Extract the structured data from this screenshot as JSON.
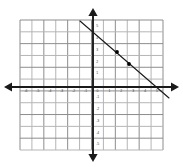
{
  "figure": {
    "background_color": "#ffffff"
  },
  "colors": {
    "grid_line": "#8d8d8d",
    "grid_line_light": "#b5b5b5",
    "axis": "#1a1a1a",
    "graph_line": "#1a1a1a",
    "point_marker": "#000000",
    "tick_label": "#3a3a3a"
  },
  "grid": {
    "left_px": 20,
    "top_px": 20,
    "right_px": 163,
    "bottom_px": 150,
    "cell_px": 11.9,
    "columns": 12,
    "rows": 11,
    "show_grid": true
  },
  "axes": {
    "x_axis": {
      "label": "",
      "origin_px": 87,
      "arrow_left_px": 4,
      "arrow_right_px": 179,
      "min": -6,
      "max": 6,
      "tick_labels": [
        "-6",
        "-5",
        "-4",
        "-3",
        "-2",
        "-1",
        "0",
        "1",
        "2",
        "3",
        "4",
        "5"
      ]
    },
    "y_axis": {
      "label": "",
      "origin_px": 93,
      "arrow_top_px": 8,
      "arrow_bottom_px": 162,
      "min": -5,
      "max": 5,
      "tick_labels": [
        "5",
        "4",
        "3",
        "2",
        "1",
        "-1",
        "-2",
        "-3",
        "-4",
        "-5"
      ]
    }
  },
  "chart_data": {
    "type": "line",
    "title": "",
    "xlabel": "",
    "ylabel": "",
    "xlim": [
      -6,
      6
    ],
    "ylim": [
      -5,
      5
    ],
    "grid": true,
    "legend": "none",
    "series": [
      {
        "name": "line",
        "equation": "y = -0.5x + 3",
        "slope": -0.5,
        "intercept": 3,
        "x": [
          -1,
          0,
          1,
          2,
          3,
          4,
          5,
          6,
          7
        ],
        "y": [
          3.5,
          3,
          2.5,
          2,
          1.5,
          1,
          0.5,
          0,
          -0.5
        ],
        "endpoint_start_px": {
          "x": 80,
          "y": 21
        },
        "endpoint_end_px": {
          "x": 169,
          "y": 98
        },
        "marked_points": [
          {
            "x": 2,
            "y": 2,
            "px": 117,
            "py": 52
          },
          {
            "x": 4,
            "y": 1,
            "px": 129,
            "py": 64
          }
        ]
      }
    ]
  }
}
